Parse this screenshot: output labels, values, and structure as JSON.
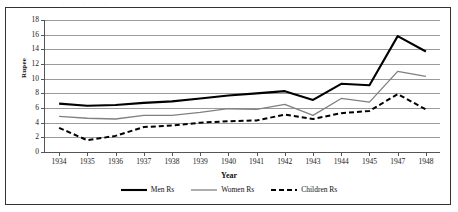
{
  "figure": {
    "scan_artifact_text": ". . . . . ."
  },
  "chart_data": {
    "type": "line",
    "title": "",
    "xlabel": "Year",
    "ylabel": "Rupee",
    "categories": [
      "1934",
      "1935",
      "1936",
      "1937",
      "1938",
      "1939",
      "1940",
      "1941",
      "1942",
      "1943",
      "1944",
      "1945",
      "1947",
      "1948"
    ],
    "ylim": [
      0,
      18
    ],
    "ytick_step": 2,
    "yticks": [
      0,
      2,
      4,
      6,
      8,
      10,
      12,
      14,
      16,
      18
    ],
    "grid": "horizontal",
    "legend_position": "bottom",
    "series": [
      {
        "name": "Men Rs",
        "color": "#000000",
        "style": "solid",
        "width": 2.1,
        "values": [
          6.6,
          6.3,
          6.4,
          6.7,
          6.9,
          7.3,
          7.7,
          8.0,
          8.3,
          7.1,
          9.3,
          9.1,
          15.8,
          13.7
        ]
      },
      {
        "name": "Women Rs",
        "color": "#808080",
        "style": "solid",
        "width": 1.3,
        "values": [
          4.85,
          4.6,
          4.5,
          5.0,
          5.0,
          5.4,
          5.9,
          5.8,
          6.5,
          5.0,
          7.3,
          6.8,
          11.0,
          10.3
        ]
      },
      {
        "name": "Children Rs",
        "color": "#000000",
        "style": "dashed",
        "width": 2.0,
        "values": [
          3.3,
          1.6,
          2.2,
          3.4,
          3.6,
          4.0,
          4.2,
          4.3,
          5.1,
          4.5,
          5.3,
          5.6,
          7.9,
          5.8
        ]
      }
    ]
  }
}
